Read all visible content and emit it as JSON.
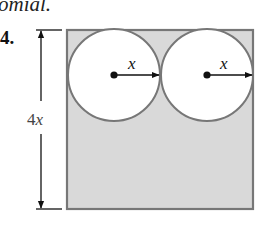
{
  "header": {
    "partial_text": "omial."
  },
  "problem": {
    "number": "4."
  },
  "figure": {
    "height_label": "4x",
    "radius_labels": [
      "x",
      "x"
    ],
    "colors": {
      "shaded_fill": "#d9d9d9",
      "outline": "#777777",
      "circle_fill": "#ffffff",
      "ink": "#111111"
    }
  }
}
